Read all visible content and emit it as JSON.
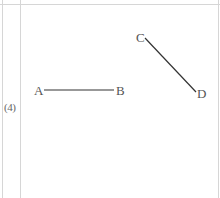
{
  "problem": {
    "number": "(4)",
    "segments": [
      {
        "from": "A",
        "to": "B",
        "x1": 44,
        "y1": 90,
        "x2": 114,
        "y2": 90
      },
      {
        "from": "C",
        "to": "D",
        "x1": 145,
        "y1": 38,
        "x2": 196,
        "y2": 92
      }
    ],
    "points": {
      "A": {
        "label": "A",
        "x": 34,
        "y": 84
      },
      "B": {
        "label": "B",
        "x": 116,
        "y": 84
      },
      "C": {
        "label": "C",
        "x": 136,
        "y": 31
      },
      "D": {
        "label": "D",
        "x": 197,
        "y": 87
      }
    },
    "line_color": "#333333"
  }
}
